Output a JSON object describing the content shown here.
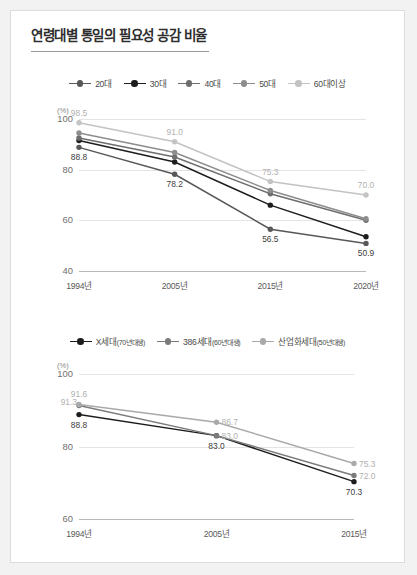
{
  "header": {
    "title": "연령대별 통일의 필요성 공감 비율"
  },
  "colors": {
    "s20": "#585858",
    "s30": "#1d1d1d",
    "s40": "#6e6e6e",
    "s50": "#8d8d8d",
    "s60": "#c3c3c3",
    "x_gen": "#1d1d1d",
    "gen386": "#7b7b7b",
    "ind_gen": "#a9a9a9",
    "grid": "#e4e4e4",
    "axis": "#b9b9b9"
  },
  "chart_data": [
    {
      "id": "chart-age-groups",
      "type": "line",
      "title": "연령대별 통일의 필요성 공감 비율",
      "ylabel": "(%)",
      "xlabel": "",
      "ylim": [
        40,
        100
      ],
      "yticks": [
        "100",
        "80",
        "60",
        "40"
      ],
      "grid": true,
      "legend_position": "top",
      "categories": [
        "1994년",
        "2005년",
        "2015년",
        "2020년"
      ],
      "series": [
        {
          "name": "20대",
          "color_key": "s20",
          "values": [
            88.8,
            78.2,
            56.5,
            50.9
          ],
          "labels": [
            {
              "text": "88.8",
              "show": true,
              "pos": "below",
              "tone": "dark"
            },
            {
              "text": "78.2",
              "show": true,
              "pos": "below",
              "tone": "dark"
            },
            {
              "text": "56.5",
              "show": true,
              "pos": "below",
              "tone": "dark"
            },
            {
              "text": "50.9",
              "show": true,
              "pos": "below",
              "tone": "dark"
            }
          ]
        },
        {
          "name": "30대",
          "color_key": "s30",
          "values": [
            91.5,
            83.0,
            66.0,
            53.5
          ],
          "labels": [
            {
              "text": "",
              "show": false
            },
            {
              "text": "",
              "show": false
            },
            {
              "text": "",
              "show": false
            },
            {
              "text": "",
              "show": false
            }
          ]
        },
        {
          "name": "40대",
          "color_key": "s40",
          "values": [
            92.5,
            85.0,
            70.5,
            60.0
          ],
          "labels": [
            {
              "text": "",
              "show": false
            },
            {
              "text": "",
              "show": false
            },
            {
              "text": "",
              "show": false
            },
            {
              "text": "",
              "show": false
            }
          ]
        },
        {
          "name": "50대",
          "color_key": "s50",
          "values": [
            94.5,
            86.8,
            71.8,
            60.6
          ],
          "labels": [
            {
              "text": "",
              "show": false
            },
            {
              "text": "",
              "show": false
            },
            {
              "text": "",
              "show": false
            },
            {
              "text": "",
              "show": false
            }
          ]
        },
        {
          "name": "60대이상",
          "color_key": "s60",
          "values": [
            98.5,
            91.0,
            75.3,
            70.0
          ],
          "labels": [
            {
              "text": "98.5",
              "show": true,
              "pos": "above",
              "tone": "light"
            },
            {
              "text": "91.0",
              "show": true,
              "pos": "above",
              "tone": "light"
            },
            {
              "text": "75.3",
              "show": true,
              "pos": "above",
              "tone": "light"
            },
            {
              "text": "70.0",
              "show": true,
              "pos": "above",
              "tone": "light"
            }
          ]
        }
      ]
    },
    {
      "id": "chart-generations",
      "type": "line",
      "title": "",
      "ylabel": "(%)",
      "xlabel": "",
      "ylim": [
        60,
        100
      ],
      "yticks": [
        "100",
        "80",
        "60"
      ],
      "grid": true,
      "legend_position": "top",
      "categories": [
        "1994년",
        "2005년",
        "2015년"
      ],
      "series": [
        {
          "name": "X세대",
          "name_sub": "(70년대생)",
          "color_key": "x_gen",
          "values": [
            88.8,
            83.0,
            70.3
          ],
          "labels": [
            {
              "text": "88.8",
              "show": true,
              "pos": "below",
              "tone": "dark"
            },
            {
              "text": "83.0",
              "show": true,
              "pos": "below",
              "tone": "dark"
            },
            {
              "text": "70.3",
              "show": true,
              "pos": "below",
              "tone": "dark"
            }
          ]
        },
        {
          "name": "386세대",
          "name_sub": "(60년대생)",
          "color_key": "gen386",
          "values": [
            91.3,
            83.0,
            72.0
          ],
          "labels": [
            {
              "text": "91.3",
              "show": true,
              "pos": "left",
              "tone": "light"
            },
            {
              "text": "83.0",
              "show": true,
              "pos": "right",
              "tone": "light"
            },
            {
              "text": "72.0",
              "show": true,
              "pos": "right",
              "tone": "light"
            }
          ]
        },
        {
          "name": "산업화세대",
          "name_sub": "(50년대생)",
          "color_key": "ind_gen",
          "values": [
            91.6,
            86.7,
            75.3
          ],
          "labels": [
            {
              "text": "91.6",
              "show": true,
              "pos": "above",
              "tone": "light"
            },
            {
              "text": "86.7",
              "show": true,
              "pos": "right",
              "tone": "light"
            },
            {
              "text": "75.3",
              "show": true,
              "pos": "right",
              "tone": "light"
            }
          ]
        }
      ]
    }
  ],
  "legend1": {
    "items": [
      {
        "label": "20대",
        "color_key": "s20"
      },
      {
        "label": "30대",
        "color_key": "s30"
      },
      {
        "label": "40대",
        "color_key": "s40"
      },
      {
        "label": "50대",
        "color_key": "s50"
      },
      {
        "label": "60대이상",
        "color_key": "s60"
      }
    ]
  },
  "legend2": {
    "items": [
      {
        "label": "X세대",
        "sub": "(70년대생)",
        "color_key": "x_gen"
      },
      {
        "label": "386세대",
        "sub": "(60년대생)",
        "color_key": "gen386"
      },
      {
        "label": "산업화세대",
        "sub": "(50년대생)",
        "color_key": "ind_gen"
      }
    ]
  }
}
